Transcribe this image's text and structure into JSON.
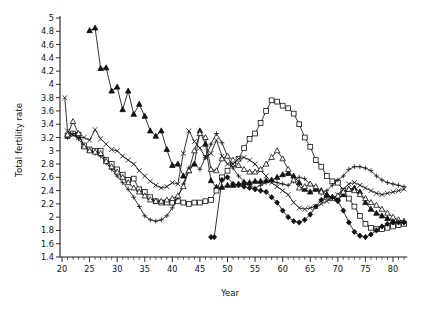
{
  "chart_data": {
    "type": "line",
    "title": "",
    "xlabel": "Year",
    "ylabel": "Total fertility rate",
    "xlim": [
      19.5,
      82.5
    ],
    "ylim": [
      1.4,
      5.0
    ],
    "ytick_step": 0.2,
    "xtick_step": 5,
    "xtick_minor_step": 1,
    "grid": false,
    "legend": "none",
    "xticks": [
      20,
      25,
      30,
      35,
      40,
      45,
      50,
      55,
      60,
      65,
      70,
      75,
      80
    ],
    "xtick_labels": [
      "20",
      "25",
      "30",
      "35",
      "40",
      "45",
      "50",
      "55",
      "60",
      "65",
      "70",
      "75",
      "80"
    ],
    "yticks": [
      1.4,
      1.6,
      1.8,
      2.0,
      2.2,
      2.4,
      2.6,
      2.8,
      3.0,
      3.2,
      3.4,
      3.6,
      3.8,
      4.0,
      4.2,
      4.4,
      4.6,
      4.8,
      5.0
    ],
    "ytick_labels": [
      "1.4",
      "1.6",
      "1.8",
      "2",
      "2.2",
      "2.4",
      "2.6",
      "2.8",
      "3",
      "3.2",
      "3.4",
      "3.6",
      "3.8",
      "4",
      "4.2",
      "4.4",
      "4.6",
      "4.8",
      "5"
    ],
    "series": [
      {
        "name": "series-triangle",
        "marker": "triangle",
        "fill": "solid",
        "x": [
          25,
          26,
          27,
          28,
          29,
          30,
          31,
          32,
          33,
          34,
          35,
          36,
          37,
          38,
          39,
          40,
          41,
          42,
          43,
          44,
          45,
          46,
          47,
          48,
          49,
          50,
          51,
          52,
          53,
          54,
          55,
          56,
          57,
          58,
          59,
          60,
          61,
          62,
          63,
          64,
          65,
          66,
          67,
          68,
          69,
          70,
          71,
          72,
          73,
          74,
          75,
          76,
          77,
          78,
          79,
          80,
          81,
          82
        ],
        "y": [
          4.81,
          4.85,
          4.24,
          4.25,
          3.9,
          3.96,
          3.62,
          3.9,
          3.55,
          3.7,
          3.52,
          3.3,
          3.22,
          3.3,
          3.02,
          2.78,
          2.8,
          2.62,
          2.7,
          2.8,
          3.3,
          3.1,
          2.55,
          2.45,
          2.45,
          2.48,
          2.48,
          2.5,
          2.52,
          2.52,
          2.54,
          2.54,
          2.55,
          2.56,
          2.6,
          2.64,
          2.66,
          2.62,
          2.52,
          2.42,
          2.38,
          2.42,
          2.4,
          2.34,
          2.3,
          2.28,
          2.34,
          2.42,
          2.44,
          2.38,
          2.22,
          2.12,
          2.06,
          2.02,
          1.98,
          1.94,
          1.92,
          1.9
        ]
      },
      {
        "name": "series-square",
        "marker": "square",
        "fill": "open",
        "x": [
          21,
          22,
          23,
          24,
          25,
          26,
          27,
          28,
          29,
          30,
          31,
          32,
          33,
          34,
          35,
          36,
          37,
          38,
          39,
          40,
          41,
          42,
          43,
          44,
          45,
          46,
          47,
          48,
          49,
          50,
          51,
          52,
          53,
          54,
          55,
          56,
          57,
          58,
          59,
          60,
          61,
          62,
          63,
          64,
          65,
          66,
          67,
          68,
          69,
          70,
          71,
          72,
          73,
          74,
          75,
          76,
          77,
          78,
          79,
          80,
          81,
          82
        ],
        "y": [
          3.22,
          3.26,
          3.24,
          3.08,
          3.02,
          3.0,
          3.0,
          2.86,
          2.8,
          2.72,
          2.64,
          2.56,
          2.58,
          2.42,
          2.38,
          2.3,
          2.24,
          2.22,
          2.22,
          2.22,
          2.24,
          2.22,
          2.2,
          2.22,
          2.22,
          2.24,
          2.26,
          2.4,
          2.6,
          2.7,
          2.8,
          2.88,
          3.04,
          3.18,
          3.26,
          3.42,
          3.6,
          3.76,
          3.74,
          3.68,
          3.64,
          3.56,
          3.4,
          3.2,
          3.06,
          2.86,
          2.76,
          2.62,
          2.54,
          2.52,
          2.4,
          2.28,
          2.16,
          2.02,
          1.9,
          1.84,
          1.82,
          1.82,
          1.84,
          1.86,
          1.88,
          1.9
        ]
      },
      {
        "name": "series-plus",
        "marker": "plus",
        "fill": "solid",
        "x": [
          21,
          22,
          23,
          24,
          25,
          26,
          27,
          28,
          29,
          30,
          31,
          32,
          33,
          34,
          35,
          36,
          37,
          38,
          39,
          40,
          41,
          42,
          43,
          44,
          45,
          46,
          47,
          48,
          49,
          50,
          51,
          52,
          53,
          54,
          55,
          56,
          57,
          58,
          59,
          60,
          61,
          62,
          63,
          64,
          65,
          66,
          67,
          68,
          69,
          70,
          71,
          72,
          73,
          74,
          75,
          76,
          77,
          78,
          79,
          80,
          81,
          82
        ],
        "y": [
          3.2,
          3.26,
          3.18,
          3.06,
          3.0,
          2.96,
          2.92,
          2.82,
          2.72,
          2.62,
          2.52,
          2.42,
          2.3,
          2.16,
          2.02,
          1.96,
          1.94,
          1.96,
          2.02,
          2.14,
          2.3,
          2.5,
          2.74,
          2.8,
          2.72,
          2.9,
          3.1,
          3.26,
          3.12,
          2.92,
          2.74,
          2.62,
          2.54,
          2.48,
          2.44,
          2.48,
          2.52,
          2.54,
          2.52,
          2.5,
          2.48,
          2.54,
          2.6,
          2.58,
          2.5,
          2.42,
          2.36,
          2.4,
          2.48,
          2.56,
          2.62,
          2.72,
          2.76,
          2.76,
          2.74,
          2.7,
          2.62,
          2.56,
          2.52,
          2.5,
          2.48,
          2.46
        ]
      },
      {
        "name": "series-cross",
        "marker": "cross",
        "fill": "solid",
        "x": [
          20.5,
          21,
          22,
          23,
          24,
          25,
          26,
          27,
          28,
          29,
          30,
          31,
          32,
          33,
          34,
          35,
          36,
          37,
          38,
          39,
          40,
          41,
          42,
          43,
          44,
          45,
          46,
          47,
          48,
          49,
          50,
          51,
          52,
          53,
          54,
          55,
          56,
          57,
          58,
          59,
          60,
          61,
          62,
          63,
          64,
          65,
          66,
          67,
          68,
          69,
          70,
          71,
          72,
          73,
          74,
          75,
          76,
          77,
          78,
          79,
          80,
          81,
          82
        ],
        "y": [
          3.8,
          3.3,
          3.24,
          3.2,
          3.2,
          3.16,
          3.32,
          3.18,
          3.1,
          3.02,
          3.0,
          2.92,
          2.86,
          2.8,
          2.7,
          2.62,
          2.54,
          2.48,
          2.44,
          2.46,
          2.52,
          2.5,
          2.96,
          3.3,
          3.14,
          3.04,
          2.9,
          2.96,
          3.16,
          2.92,
          2.8,
          2.8,
          2.88,
          2.9,
          2.86,
          2.8,
          2.7,
          2.62,
          2.52,
          2.46,
          2.4,
          2.34,
          2.22,
          2.14,
          2.12,
          2.14,
          2.16,
          2.2,
          2.24,
          2.28,
          2.34,
          2.42,
          2.5,
          2.52,
          2.48,
          2.44,
          2.4,
          2.36,
          2.34,
          2.36,
          2.38,
          2.4,
          2.42
        ]
      },
      {
        "name": "series-triangle-open",
        "marker": "triangle-open",
        "fill": "open",
        "x": [
          21,
          22,
          23,
          24,
          25,
          26,
          27,
          28,
          29,
          30,
          31,
          32,
          33,
          34,
          35,
          36,
          37,
          38,
          39,
          40,
          41,
          42,
          43,
          44,
          45,
          46,
          47,
          48,
          49,
          50,
          51,
          52,
          53,
          54,
          55,
          56,
          57,
          58,
          59,
          60,
          61,
          62,
          63,
          64,
          65,
          66,
          67,
          68,
          69,
          70,
          71,
          72,
          73,
          74,
          75,
          76,
          77,
          78,
          79,
          80,
          81,
          82
        ],
        "y": [
          3.24,
          3.44,
          3.26,
          3.06,
          3.0,
          2.98,
          2.96,
          2.84,
          2.76,
          2.68,
          2.6,
          2.52,
          2.44,
          2.38,
          2.32,
          2.26,
          2.24,
          2.24,
          2.26,
          2.28,
          2.32,
          2.46,
          2.7,
          3.0,
          3.26,
          3.2,
          2.72,
          2.7,
          2.88,
          2.92,
          2.86,
          2.78,
          2.72,
          2.68,
          2.68,
          2.72,
          2.8,
          2.9,
          3.0,
          2.88,
          2.72,
          2.56,
          2.44,
          2.46,
          2.5,
          2.46,
          2.38,
          2.3,
          2.28,
          2.32,
          2.38,
          2.42,
          2.4,
          2.34,
          2.28,
          2.22,
          2.18,
          2.12,
          2.06,
          2.0,
          1.96,
          1.94
        ]
      },
      {
        "name": "series-diamond",
        "marker": "diamond",
        "fill": "solid",
        "x": [
          47,
          47.6,
          49,
          50,
          51,
          52,
          53,
          54,
          55,
          56,
          57,
          58,
          59,
          60,
          61,
          62,
          63,
          64,
          65,
          66,
          67,
          68,
          69,
          70,
          71,
          72,
          73,
          74,
          75,
          76,
          77,
          78,
          79,
          80,
          81,
          82
        ],
        "y": [
          1.7,
          1.7,
          2.56,
          2.6,
          2.5,
          2.48,
          2.46,
          2.44,
          2.42,
          2.4,
          2.38,
          2.3,
          2.22,
          2.1,
          2.0,
          1.94,
          1.92,
          1.96,
          2.04,
          2.16,
          2.26,
          2.32,
          2.3,
          2.24,
          2.1,
          1.92,
          1.78,
          1.72,
          1.7,
          1.74,
          1.8,
          1.86,
          1.9,
          1.92,
          1.92,
          1.92
        ]
      }
    ]
  }
}
